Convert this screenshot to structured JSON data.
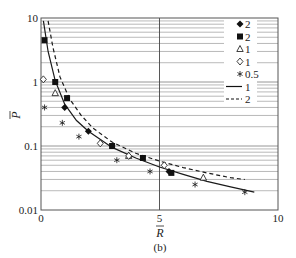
{
  "chart_data": {
    "type": "scatter",
    "title": "",
    "caption": "(b)",
    "xlabel": "R̄",
    "ylabel": "P̄",
    "xlim": [
      0,
      10
    ],
    "ylim": [
      0.01,
      10
    ],
    "yscale": "log",
    "xticks": [
      "0",
      "5",
      "10"
    ],
    "yticks": [
      "0.01",
      "0.1",
      "1",
      "10"
    ],
    "grid": {
      "x_major_at": [
        5
      ],
      "y": "log minor grid"
    },
    "legend_position": "upper right",
    "series": [
      {
        "name": "2",
        "marker": "filled-diamond",
        "points": [
          [
            1.0,
            0.4
          ],
          [
            2.0,
            0.17
          ],
          [
            5.4,
            0.04
          ]
        ]
      },
      {
        "name": "2",
        "marker": "filled-square",
        "points": [
          [
            0.15,
            4.5
          ],
          [
            0.6,
            1.0
          ],
          [
            1.1,
            0.56
          ],
          [
            3.0,
            0.1
          ],
          [
            4.3,
            0.065
          ],
          [
            5.5,
            0.038
          ]
        ]
      },
      {
        "name": "1",
        "marker": "open-triangle",
        "points": [
          [
            0.6,
            0.67
          ],
          [
            3.7,
            0.07
          ],
          [
            6.85,
            0.032
          ]
        ]
      },
      {
        "name": "1",
        "marker": "open-diamond",
        "points": [
          [
            0.1,
            1.1
          ],
          [
            2.5,
            0.11
          ],
          [
            3.7,
            0.07
          ],
          [
            5.2,
            0.05
          ]
        ]
      },
      {
        "name": "0.5",
        "marker": "asterisk",
        "points": [
          [
            0.15,
            0.4
          ],
          [
            0.9,
            0.23
          ],
          [
            1.6,
            0.14
          ],
          [
            3.2,
            0.06
          ],
          [
            4.6,
            0.04
          ],
          [
            6.5,
            0.025
          ],
          [
            8.6,
            0.019
          ]
        ]
      },
      {
        "name": "1",
        "style": "solid-line",
        "points": [
          [
            0.1,
            9.0
          ],
          [
            0.3,
            3.0
          ],
          [
            0.6,
            1.05
          ],
          [
            1.0,
            0.45
          ],
          [
            1.5,
            0.25
          ],
          [
            2.0,
            0.17
          ],
          [
            3.0,
            0.095
          ],
          [
            4.0,
            0.065
          ],
          [
            5.0,
            0.047
          ],
          [
            6.0,
            0.036
          ],
          [
            7.0,
            0.028
          ],
          [
            8.0,
            0.023
          ],
          [
            9.0,
            0.019
          ]
        ]
      },
      {
        "name": "2",
        "style": "dashed-line",
        "points": [
          [
            0.3,
            9.0
          ],
          [
            0.5,
            3.5
          ],
          [
            0.8,
            1.2
          ],
          [
            1.2,
            0.55
          ],
          [
            1.7,
            0.3
          ],
          [
            2.2,
            0.19
          ],
          [
            3.0,
            0.115
          ],
          [
            4.0,
            0.077
          ],
          [
            5.0,
            0.058
          ],
          [
            6.0,
            0.046
          ],
          [
            7.0,
            0.038
          ],
          [
            8.0,
            0.032
          ],
          [
            8.6,
            0.03
          ]
        ]
      }
    ]
  },
  "legend": {
    "items": [
      {
        "marker": "filled-diamond",
        "label": "2"
      },
      {
        "marker": "filled-square",
        "label": "2"
      },
      {
        "marker": "open-triangle",
        "label": "1"
      },
      {
        "marker": "open-diamond",
        "label": "1"
      },
      {
        "marker": "asterisk",
        "label": "0.5"
      },
      {
        "marker": "solid-line",
        "label": "1"
      },
      {
        "marker": "dashed-line",
        "label": "2"
      }
    ]
  },
  "axes": {
    "x_ticks": [
      {
        "label": "0",
        "value": 0
      },
      {
        "label": "5",
        "value": 5
      },
      {
        "label": "10",
        "value": 10
      }
    ],
    "y_ticks": [
      {
        "label": "10",
        "value": 10
      },
      {
        "label": "1",
        "value": 1
      },
      {
        "label": "0.1",
        "value": 0.1
      },
      {
        "label": "0.01",
        "value": 0.01
      }
    ],
    "x_label": "R",
    "y_label": "P",
    "caption": "(b)"
  },
  "colors": {
    "line": "#1a1a1a",
    "grid": "#8a8a8a",
    "frame": "#555555",
    "marker": "#111111"
  }
}
